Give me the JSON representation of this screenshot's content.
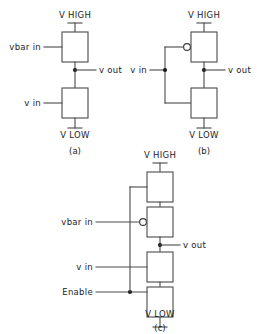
{
  "figure": {
    "type": "circuit-diagram",
    "line_color": "#4a4a4a",
    "text_color": "#1c1c1c",
    "background": "#ffffff"
  },
  "circuits": [
    {
      "id": "a",
      "caption": "(a)",
      "rail_top": "V HIGH",
      "rail_bottom": "V LOW",
      "output": "v out",
      "inputs": [
        {
          "label": "vbar in",
          "inverted": false
        },
        {
          "label": "v in",
          "inverted": false
        }
      ],
      "devices": 2
    },
    {
      "id": "b",
      "caption": "(b)",
      "rail_top": "V HIGH",
      "rail_bottom": "V LOW",
      "output": "v out",
      "inputs": [
        {
          "label": "v in",
          "inverted": true
        }
      ],
      "devices": 2
    },
    {
      "id": "c",
      "caption": "(c)",
      "rail_top": "V HIGH",
      "rail_bottom": "V LOW",
      "output": "v out",
      "inputs": [
        {
          "label": "vbar in",
          "inverted": true
        },
        {
          "label": "v in",
          "inverted": false
        },
        {
          "label": "Enable",
          "inverted": false
        }
      ],
      "devices": 4
    }
  ],
  "labels": {
    "a_vhigh": "V HIGH",
    "a_vlow": "V LOW",
    "a_vbar_in": "vbar in",
    "a_v_in": "v in",
    "a_v_out": "v out",
    "a_caption": "(a)",
    "b_vhigh": "V HIGH",
    "b_vlow": "V LOW",
    "b_v_in": "v in",
    "b_v_out": "v out",
    "b_caption": "(b)",
    "c_vhigh": "V HIGH",
    "c_vlow": "V LOW",
    "c_vbar_in": "vbar in",
    "c_v_in": "v in",
    "c_enable": "Enable",
    "c_v_out": "v out",
    "c_caption": "(c)"
  }
}
